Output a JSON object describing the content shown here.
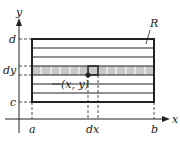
{
  "diagram": {
    "axis_labels": {
      "x": "x",
      "y": "y"
    },
    "region_label": "R",
    "y_ticks": {
      "top": "d",
      "strip": "dy",
      "bottom": "c"
    },
    "x_ticks": {
      "left": "a",
      "strip": "dx",
      "right": "b"
    },
    "point_label": "(x, y)",
    "colors": {
      "line": "#222222",
      "strip_fill": "#c8c8c8",
      "background": "#ffffff"
    }
  }
}
